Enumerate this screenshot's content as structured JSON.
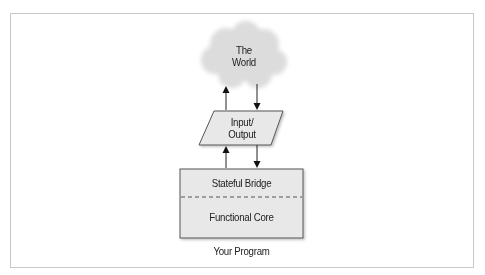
{
  "diagram": {
    "nodes": {
      "world": {
        "line1": "The",
        "line2": "World",
        "shape": "cloud"
      },
      "io": {
        "line1": "Input/",
        "line2": "Output",
        "shape": "parallelogram"
      },
      "program": {
        "top_section": "Stateful Bridge",
        "bottom_section": "Functional Core",
        "caption": "Your Program",
        "shape": "rectangle-with-dashed-divider"
      }
    },
    "edges": [
      {
        "from": "io",
        "to": "world",
        "direction": "up"
      },
      {
        "from": "world",
        "to": "io",
        "direction": "down"
      },
      {
        "from": "program",
        "to": "io",
        "direction": "up"
      },
      {
        "from": "io",
        "to": "program",
        "direction": "down"
      }
    ],
    "colors": {
      "fill": "#e6e6e6",
      "stroke": "#555555",
      "frame": "#c8c8c8",
      "text": "#222222"
    }
  }
}
